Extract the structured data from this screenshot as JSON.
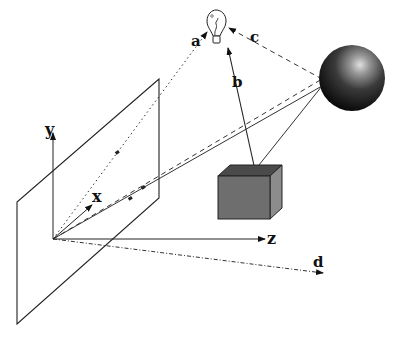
{
  "diagram": {
    "axes": {
      "x_label": "x",
      "y_label": "y",
      "z_label": "z"
    },
    "rays": {
      "a_label": "a",
      "b_label": "b",
      "c_label": "c",
      "d_label": "d"
    },
    "objects": {
      "light": "light-bulb",
      "sphere": "reflective-sphere",
      "cube": "gray-cube",
      "plane": "image-plane"
    },
    "colors": {
      "stroke": "#222222",
      "cube_front": "#6e6e6e",
      "cube_top": "#4a4a4a",
      "cube_side": "#8c8c8c",
      "sphere_dark": "#0a0a0a",
      "sphere_highlight": "#d8d8d8"
    }
  }
}
